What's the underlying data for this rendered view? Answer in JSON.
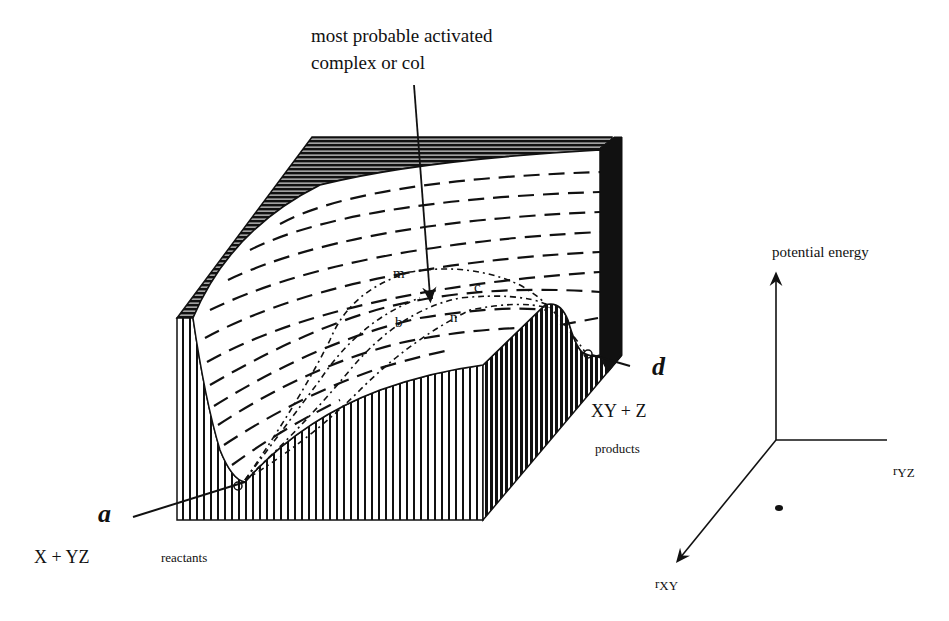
{
  "figure": {
    "callout": {
      "line1": "most probable activated",
      "line2": "complex or col"
    },
    "path_labels": {
      "m": "m",
      "b": "b",
      "c": "c",
      "n": "n"
    },
    "points": {
      "a": "a",
      "d": "d"
    },
    "reactants": {
      "formula": "X + YZ",
      "label": "reactants"
    },
    "products": {
      "formula": "XY + Z",
      "label": "products"
    },
    "axes": {
      "vertical": "potential energy",
      "horizontal_prefix": "r",
      "horizontal_sub": "YZ",
      "depth_prefix": "r",
      "depth_sub": "XY"
    },
    "colors": {
      "ink": "#111111",
      "paper": "#ffffff"
    }
  }
}
